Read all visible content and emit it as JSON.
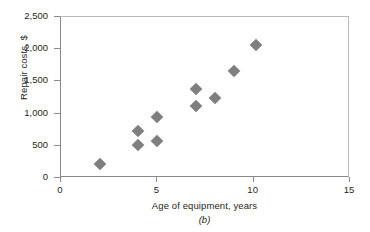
{
  "figure": {
    "caption": "(b)",
    "marker_color": "#7f7f7f",
    "axis_color": "#8a8a8a",
    "text_color": "#231f20"
  },
  "chart_data": {
    "type": "scatter",
    "title": "",
    "xlabel": "Age of equipment, years",
    "ylabel": "Repair costs, $",
    "xlim": [
      0,
      15
    ],
    "ylim": [
      0,
      2500
    ],
    "xticks": [
      0,
      5,
      10,
      15
    ],
    "yticks": [
      0,
      500,
      1000,
      1500,
      2000,
      2500
    ],
    "xtick_labels": [
      "0",
      "5",
      "10",
      "15"
    ],
    "ytick_labels": [
      "0",
      "500",
      "1,000",
      "1,500",
      "2,000",
      "2,500"
    ],
    "grid": false,
    "legend": false,
    "marker": "diamond",
    "series": [
      {
        "name": "Repair costs vs age",
        "points": [
          {
            "x": 2.0,
            "y": 215
          },
          {
            "x": 4.0,
            "y": 725
          },
          {
            "x": 4.0,
            "y": 505
          },
          {
            "x": 5.0,
            "y": 940
          },
          {
            "x": 5.0,
            "y": 570
          },
          {
            "x": 7.0,
            "y": 1385
          },
          {
            "x": 7.0,
            "y": 1125
          },
          {
            "x": 8.0,
            "y": 1240
          },
          {
            "x": 9.0,
            "y": 1655
          },
          {
            "x": 10.1,
            "y": 2060
          }
        ]
      }
    ]
  }
}
